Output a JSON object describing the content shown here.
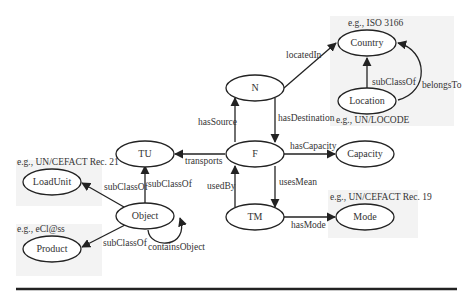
{
  "diagram": {
    "type": "ontology-graph",
    "nodes": {
      "country": {
        "label": "Country",
        "example": "e.g., ISO 3166"
      },
      "location": {
        "label": "Location",
        "example": "e.g., UN/LOCODE"
      },
      "n": {
        "label": "N"
      },
      "f": {
        "label": "F"
      },
      "tu": {
        "label": "TU"
      },
      "capacity": {
        "label": "Capacity"
      },
      "tm": {
        "label": "TM"
      },
      "mode": {
        "label": "Mode",
        "example": "e.g., UN/CEFACT Rec. 19"
      },
      "object": {
        "label": "Object"
      },
      "loadunit": {
        "label": "LoadUnit",
        "example": "e.g., UN/CEFACT Rec. 21"
      },
      "product": {
        "label": "Product",
        "example": "e.g., eCl@ss"
      }
    },
    "edges": {
      "locatedIn": {
        "label": "locatedIn",
        "from": "N",
        "to": "Country"
      },
      "subClassOfLoc": {
        "label": "subClassOf",
        "from": "Location",
        "to": "Country"
      },
      "belongsTo": {
        "label": "belongsTo",
        "from": "Location",
        "to": "Country"
      },
      "hasSource": {
        "label": "hasSource",
        "from": "F",
        "to": "N"
      },
      "hasDestination": {
        "label": "hasDestination",
        "from": "N",
        "to": "F"
      },
      "transports": {
        "label": "transports",
        "from": "F",
        "to": "TU"
      },
      "hasCapacity": {
        "label": "hasCapacity",
        "from": "F",
        "to": "Capacity"
      },
      "usedBy": {
        "label": "usedBy",
        "from": "TM",
        "to": "F"
      },
      "usesMean": {
        "label": "usesMean",
        "from": "F",
        "to": "TM"
      },
      "hasMode": {
        "label": "hasMode",
        "from": "TM",
        "to": "Mode"
      },
      "subClassOfTU": {
        "label": "subClassOf",
        "from": "Object",
        "to": "TU"
      },
      "subClassOfLU": {
        "label": "subClassOf",
        "from": "Object",
        "to": "LoadUnit"
      },
      "subClassOfProd": {
        "label": "subClassOf",
        "from": "Object",
        "to": "Product"
      },
      "containsObject": {
        "label": "containsObject",
        "from": "Object",
        "to": "Object"
      }
    }
  }
}
